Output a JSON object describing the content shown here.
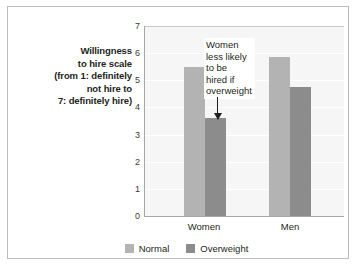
{
  "chart_data": {
    "type": "bar",
    "title": "",
    "categories": [
      "Women",
      "Men"
    ],
    "series": [
      {
        "name": "Normal",
        "values": [
          5.5,
          5.85
        ],
        "color": "#b3b3b3"
      },
      {
        "name": "Overweight",
        "values": [
          3.6,
          4.75
        ],
        "color": "#8c8c8c"
      }
    ],
    "xlabel": "",
    "ylabel": "Willingness to hire scale (from 1: definitely not hire to 7: definitely hire)",
    "ylim": [
      0,
      7
    ],
    "yticks": [
      0,
      1,
      2,
      3,
      4,
      5,
      6,
      7
    ],
    "ytick_labels": [
      "0",
      "1",
      "2",
      "3",
      "4",
      "5",
      "6",
      "7"
    ],
    "grid": true,
    "legend_position": "bottom",
    "annotations": [
      {
        "text": "Women less likely to be hired if overweight",
        "lines": [
          "Women",
          "less likely",
          "to be",
          "hired if",
          "overweight"
        ],
        "points_to": {
          "category": "Women",
          "series": "Overweight",
          "value": 3.6
        },
        "arrow": "down-arrow-icon"
      }
    ]
  },
  "axis": {
    "y_caption_lines": [
      "Willingness",
      "to hire scale",
      "(from 1: definitely",
      "not hire to",
      "7: definitely hire)"
    ],
    "ytick_labels": [
      "7",
      "6",
      "5",
      "4",
      "3",
      "2",
      "1",
      "0"
    ],
    "category_labels": [
      "Women",
      "Men"
    ]
  },
  "legend": {
    "items": [
      {
        "label": "Normal",
        "color": "#b3b3b3"
      },
      {
        "label": "Overweight",
        "color": "#8c8c8c"
      }
    ]
  },
  "annotation": {
    "lines": [
      "Women",
      "less likely",
      "to be",
      "hired if",
      "overweight"
    ]
  },
  "colors": {
    "normal": "#b3b3b3",
    "overweight": "#8c8c8c",
    "plot_background": "#f6f6f6",
    "gridline": "#ffffff",
    "axis": "#a8a8a8",
    "frame": "#bdbdbd",
    "text": "#231f20"
  }
}
